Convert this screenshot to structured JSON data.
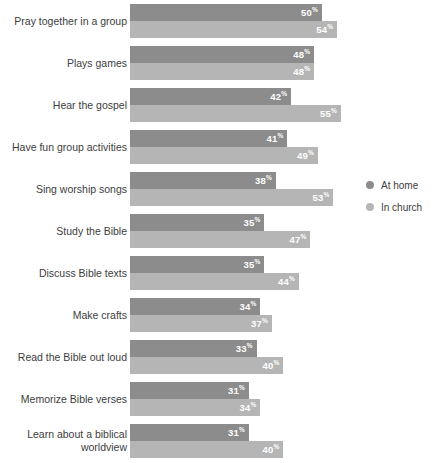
{
  "chart_data": {
    "type": "bar",
    "orientation": "horizontal",
    "title": "",
    "subtitle": "",
    "xlabel": "",
    "ylabel": "",
    "grid": false,
    "value_suffix": "%",
    "xlim": [
      0,
      60
    ],
    "legend_position": "right",
    "categories": [
      "Pray together in a group",
      "Plays games",
      "Hear the gospel",
      "Have fun group activities",
      "Sing worship songs",
      "Study the Bible",
      "Discuss Bible texts",
      "Make crafts",
      "Read the Bible out loud",
      "Memorize Bible verses",
      "Learn about a biblical\nworldview"
    ],
    "series": [
      {
        "name": "At home",
        "color": "#8c8c8c",
        "values": [
          50,
          48,
          42,
          41,
          38,
          35,
          35,
          34,
          33,
          31,
          31
        ]
      },
      {
        "name": "In church",
        "color": "#b5b5b5",
        "values": [
          54,
          48,
          55,
          49,
          53,
          47,
          44,
          37,
          40,
          34,
          40
        ]
      }
    ]
  },
  "legend": {
    "items": [
      {
        "label": "At home",
        "key": "home"
      },
      {
        "label": "In church",
        "key": "church"
      }
    ]
  },
  "colors": {
    "at_home": "#8c8c8c",
    "in_church": "#b5b5b5",
    "text": "#3d3d3d",
    "background": "#ffffff"
  }
}
